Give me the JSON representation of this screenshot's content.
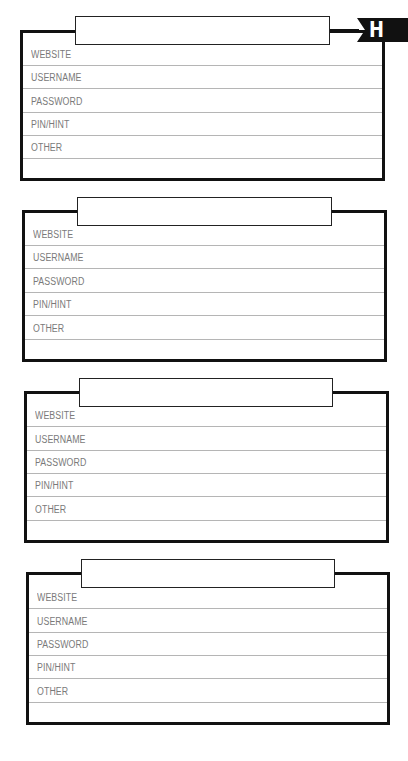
{
  "page": {
    "section_tab": "H",
    "colors": {
      "border": "#111111",
      "rule": "#b5b5b5",
      "label": "#7a7a7a",
      "tab_bg": "#111111",
      "tab_text": "#ffffff"
    }
  },
  "entries": [
    {
      "title": "",
      "fields": [
        {
          "label": "WEBSITE",
          "value": ""
        },
        {
          "label": "USERNAME",
          "value": ""
        },
        {
          "label": "PASSWORD",
          "value": ""
        },
        {
          "label": "PIN/HINT",
          "value": ""
        },
        {
          "label": "OTHER",
          "value": ""
        },
        {
          "label": "",
          "value": ""
        }
      ]
    },
    {
      "title": "",
      "fields": [
        {
          "label": "WEBSITE",
          "value": ""
        },
        {
          "label": "USERNAME",
          "value": ""
        },
        {
          "label": "PASSWORD",
          "value": ""
        },
        {
          "label": "PIN/HINT",
          "value": ""
        },
        {
          "label": "OTHER",
          "value": ""
        },
        {
          "label": "",
          "value": ""
        }
      ]
    },
    {
      "title": "",
      "fields": [
        {
          "label": "WEBSITE",
          "value": ""
        },
        {
          "label": "USERNAME",
          "value": ""
        },
        {
          "label": "PASSWORD",
          "value": ""
        },
        {
          "label": "PIN/HINT",
          "value": ""
        },
        {
          "label": "OTHER",
          "value": ""
        },
        {
          "label": "",
          "value": ""
        }
      ]
    },
    {
      "title": "",
      "fields": [
        {
          "label": "WEBSITE",
          "value": ""
        },
        {
          "label": "USERNAME",
          "value": ""
        },
        {
          "label": "PASSWORD",
          "value": ""
        },
        {
          "label": "PIN/HINT",
          "value": ""
        },
        {
          "label": "OTHER",
          "value": ""
        },
        {
          "label": "",
          "value": ""
        }
      ]
    }
  ]
}
